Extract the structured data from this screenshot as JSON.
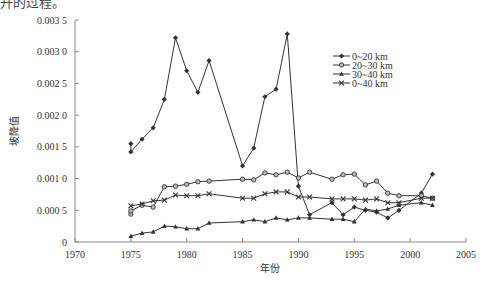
{
  "clipped_caption": "升的过程。",
  "chart_data": {
    "type": "line",
    "title": "",
    "xlabel": "年份",
    "ylabel": "坡降值",
    "xlim": [
      1970,
      2005
    ],
    "ylim": [
      0,
      0.0035
    ],
    "x_ticks": [
      1970,
      1975,
      1980,
      1985,
      1990,
      1995,
      2000,
      2005
    ],
    "x_tick_labels": [
      "1970",
      "1975",
      "1980",
      "1985",
      "1990",
      "1995",
      "2000",
      "2005"
    ],
    "y_ticks": [
      0,
      0.0005,
      0.001,
      0.0015,
      0.002,
      0.0025,
      0.003,
      0.0035
    ],
    "y_tick_labels": [
      "0",
      "0.000 5",
      "0.001 0",
      "0.001 5",
      "0.002 0",
      "0.002 5",
      "0.003 0",
      "0.003 5"
    ],
    "grid": false,
    "legend_position": "upper right (inside plot)",
    "series": [
      {
        "name": "0~20 km",
        "marker": "diamond",
        "points": [
          [
            1975,
            0.00155
          ],
          [
            1975,
            0.00142
          ],
          [
            1976,
            0.00162
          ],
          [
            1977,
            0.0018
          ],
          [
            1978,
            0.00225
          ],
          [
            1979,
            0.00322
          ],
          [
            1980,
            0.0027
          ],
          [
            1981,
            0.00236
          ],
          [
            1982,
            0.00286
          ],
          [
            1985,
            0.0012
          ],
          [
            1986,
            0.00148
          ],
          [
            1987,
            0.00229
          ],
          [
            1988,
            0.00241
          ],
          [
            1989,
            0.00328
          ],
          [
            1990,
            0.00088
          ],
          [
            1991,
            0.00043
          ],
          [
            1993,
            0.00062
          ],
          [
            1994,
            0.00043
          ],
          [
            1995,
            0.00055
          ],
          [
            1996,
            0.0005
          ],
          [
            1997,
            0.00047
          ],
          [
            1998,
            0.00038
          ],
          [
            1999,
            0.0005
          ],
          [
            2001,
            0.00077
          ],
          [
            2002,
            0.00107
          ]
        ]
      },
      {
        "name": "20~30 km",
        "marker": "circle",
        "points": [
          [
            1975,
            0.00044
          ],
          [
            1975,
            0.00049
          ],
          [
            1976,
            0.00058
          ],
          [
            1977,
            0.00055
          ],
          [
            1978,
            0.00087
          ],
          [
            1979,
            0.00088
          ],
          [
            1980,
            0.00091
          ],
          [
            1981,
            0.00095
          ],
          [
            1982,
            0.00096
          ],
          [
            1985,
            0.00099
          ],
          [
            1986,
            0.00098
          ],
          [
            1987,
            0.00109
          ],
          [
            1988,
            0.00106
          ],
          [
            1989,
            0.0011
          ],
          [
            1990,
            0.00101
          ],
          [
            1991,
            0.0011
          ],
          [
            1993,
            0.00099
          ],
          [
            1994,
            0.00106
          ],
          [
            1995,
            0.00107
          ],
          [
            1996,
            0.0009
          ],
          [
            1997,
            0.00096
          ],
          [
            1998,
            0.00077
          ],
          [
            1999,
            0.00073
          ],
          [
            2001,
            0.00073
          ],
          [
            2002,
            0.00069
          ]
        ]
      },
      {
        "name": "30~40 km",
        "marker": "triangle",
        "points": [
          [
            1975,
            9e-05
          ],
          [
            1976,
            0.00014
          ],
          [
            1977,
            0.00016
          ],
          [
            1978,
            0.00025
          ],
          [
            1979,
            0.00024
          ],
          [
            1980,
            0.00021
          ],
          [
            1981,
            0.00021
          ],
          [
            1982,
            0.0003
          ],
          [
            1985,
            0.00032
          ],
          [
            1986,
            0.00035
          ],
          [
            1987,
            0.00032
          ],
          [
            1988,
            0.00038
          ],
          [
            1989,
            0.00035
          ],
          [
            1990,
            0.00038
          ],
          [
            1991,
            0.00038
          ],
          [
            1993,
            0.00036
          ],
          [
            1994,
            0.00036
          ],
          [
            1995,
            0.00032
          ],
          [
            1996,
            0.00052
          ],
          [
            1997,
            0.00049
          ],
          [
            1998,
            0.00052
          ],
          [
            1999,
            0.00058
          ],
          [
            2001,
            0.00062
          ],
          [
            2002,
            0.00058
          ]
        ]
      },
      {
        "name": "0~40 km",
        "marker": "x",
        "points": [
          [
            1975,
            0.00057
          ],
          [
            1976,
            0.0006
          ],
          [
            1977,
            0.00065
          ],
          [
            1978,
            0.00066
          ],
          [
            1979,
            0.00074
          ],
          [
            1980,
            0.00073
          ],
          [
            1981,
            0.00073
          ],
          [
            1982,
            0.00076
          ],
          [
            1985,
            0.00069
          ],
          [
            1986,
            0.00069
          ],
          [
            1987,
            0.00076
          ],
          [
            1988,
            0.00079
          ],
          [
            1989,
            0.00079
          ],
          [
            1990,
            0.00071
          ],
          [
            1991,
            0.00071
          ],
          [
            1993,
            0.00068
          ],
          [
            1994,
            0.00068
          ],
          [
            1995,
            0.00068
          ],
          [
            1996,
            0.00066
          ],
          [
            1997,
            0.00068
          ],
          [
            1998,
            0.00062
          ],
          [
            1999,
            0.00062
          ],
          [
            2001,
            0.00069
          ],
          [
            2002,
            0.00069
          ]
        ]
      }
    ]
  },
  "colors": {
    "line": "#333333",
    "axis": "#888888",
    "text": "#333333"
  }
}
